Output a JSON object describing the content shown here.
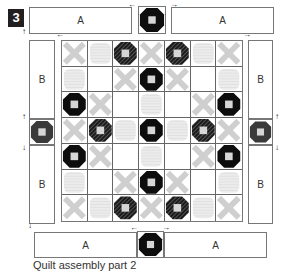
{
  "step": {
    "number": "3"
  },
  "strips": {
    "top_left": {
      "label": "A"
    },
    "top_right": {
      "label": "A"
    },
    "bottom_left": {
      "label": "A"
    },
    "bottom_right": {
      "label": "A"
    },
    "left_top": {
      "label": "B"
    },
    "left_bottom": {
      "label": "B"
    },
    "right_top": {
      "label": "B"
    },
    "right_bottom": {
      "label": "B"
    }
  },
  "center_grid": {
    "rows": 7,
    "cols": 7,
    "legend": {
      "X": "light cross block",
      "L": "light striped block",
      "W": "plain white block",
      "O": "black octagon block",
      "S": "dark striped octagon block"
    },
    "cells": [
      [
        "X",
        "L",
        "S",
        "X",
        "S",
        "L",
        "X"
      ],
      [
        "L",
        "W",
        "X",
        "O",
        "X",
        "W",
        "L"
      ],
      [
        "O",
        "X",
        "W",
        "L",
        "W",
        "X",
        "O"
      ],
      [
        "X",
        "S",
        "L",
        "O",
        "L",
        "S",
        "X"
      ],
      [
        "O",
        "X",
        "W",
        "L",
        "W",
        "X",
        "O"
      ],
      [
        "L",
        "W",
        "X",
        "O",
        "X",
        "W",
        "L"
      ],
      [
        "X",
        "L",
        "S",
        "X",
        "S",
        "L",
        "X"
      ]
    ]
  },
  "cornerstones": {
    "top": "black-octagon",
    "bottom": "black-octagon",
    "left": "dark-striped-octagon",
    "right": "dark-striped-octagon"
  },
  "arrows": {
    "left": "←",
    "right": "→",
    "up": "↑",
    "down": "↓"
  },
  "colors": {
    "badge": "#231f20",
    "octagon_black": "#0d0d0d",
    "octagon_striped": "#3a3a3a",
    "cross_gray": "#cfcfcf",
    "light_stripe": "#ececec",
    "center_square": "#d6d6d6",
    "border": "#777777"
  },
  "caption": "Quilt assembly part 2"
}
